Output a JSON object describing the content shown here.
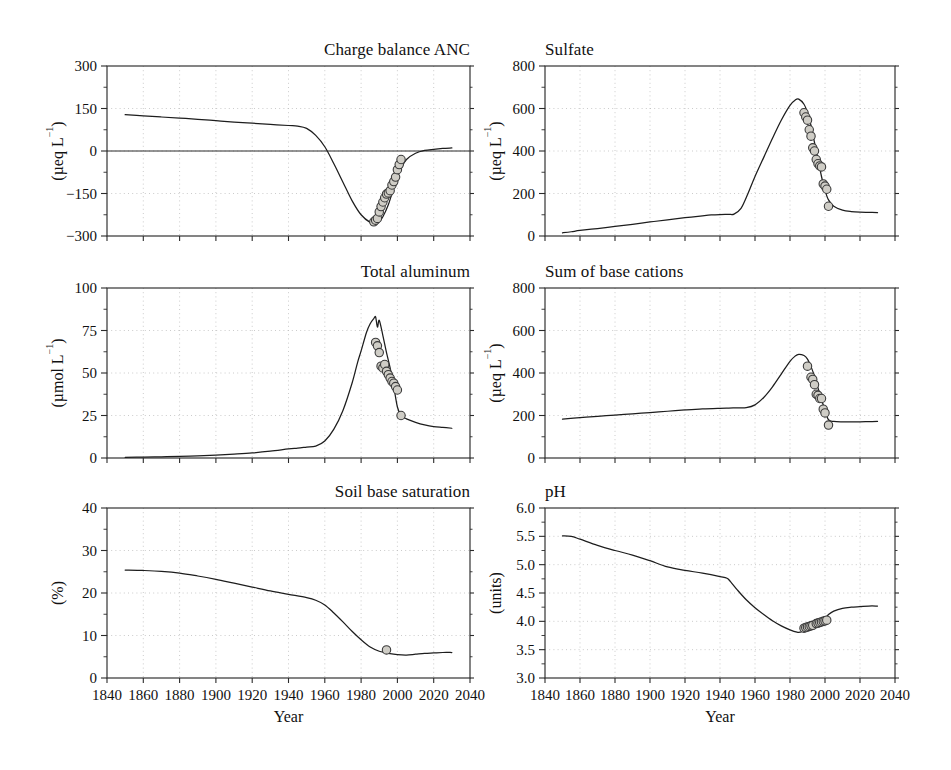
{
  "figure": {
    "xlabel": "Year",
    "marker_face_color": "#cfcdc6",
    "marker_edge_color": "#3a3a3a",
    "line_color": "#1d1d1d"
  },
  "chart_data": [
    {
      "id": "charge-balance-anc",
      "type": "line",
      "title": "Charge balance ANC",
      "xlabel": "Year",
      "ylabel": "(µeq L⁻¹)",
      "ylabel_main": "(µeq L",
      "ylabel_sup": "−1",
      "ylabel_tail": ")",
      "xlim": [
        1840,
        2040
      ],
      "ylim": [
        -300,
        300
      ],
      "xticks": [
        1840,
        1860,
        1880,
        1900,
        1920,
        1940,
        1960,
        1980,
        2000,
        2020,
        2040
      ],
      "yticks": [
        -300,
        -150,
        0,
        150,
        300
      ],
      "ytick_labels": [
        "−300",
        "−150",
        "0",
        "150",
        "300"
      ],
      "grid": true,
      "zero_line": true,
      "series": [
        {
          "name": "model",
          "x": [
            1850,
            1860,
            1870,
            1880,
            1890,
            1900,
            1910,
            1920,
            1930,
            1940,
            1945,
            1950,
            1955,
            1960,
            1965,
            1970,
            1975,
            1980,
            1985,
            1988,
            1990,
            1992,
            1995,
            1998,
            2000,
            2002,
            2005,
            2010,
            2015,
            2020,
            2025,
            2030
          ],
          "y": [
            128,
            124,
            120,
            116,
            112,
            107,
            102,
            98,
            94,
            90,
            88,
            80,
            55,
            15,
            -45,
            -110,
            -175,
            -225,
            -252,
            -255,
            -248,
            -232,
            -190,
            -130,
            -92,
            -62,
            -30,
            -8,
            2,
            6,
            9,
            11
          ]
        }
      ],
      "observations": {
        "x": [
          1987,
          1988,
          1989,
          1990,
          1991,
          1992,
          1993,
          1994,
          1995,
          1996,
          1997,
          1998,
          1999,
          2000,
          2001,
          2002
        ],
        "y": [
          -250,
          -244,
          -238,
          -215,
          -196,
          -180,
          -165,
          -152,
          -148,
          -140,
          -120,
          -108,
          -92,
          -66,
          -48,
          -30
        ]
      }
    },
    {
      "id": "sulfate",
      "type": "line",
      "title": "Sulfate",
      "xlabel": "Year",
      "ylabel": "(µeq L⁻¹)",
      "ylabel_main": "(µeq L",
      "ylabel_sup": "−1",
      "ylabel_tail": ")",
      "xlim": [
        1840,
        2040
      ],
      "ylim": [
        0,
        800
      ],
      "xticks": [
        1840,
        1860,
        1880,
        1900,
        1920,
        1940,
        1960,
        1980,
        2000,
        2020,
        2040
      ],
      "yticks": [
        0,
        200,
        400,
        600,
        800
      ],
      "ytick_labels": [
        "0",
        "200",
        "400",
        "600",
        "800"
      ],
      "grid": true,
      "zero_line": false,
      "series": [
        {
          "name": "model",
          "x": [
            1850,
            1855,
            1860,
            1870,
            1880,
            1890,
            1900,
            1910,
            1920,
            1930,
            1935,
            1940,
            1945,
            1948,
            1952,
            1956,
            1960,
            1965,
            1970,
            1975,
            1980,
            1983,
            1985,
            1988,
            1990,
            1992,
            1994,
            1996,
            1998,
            2000,
            2002,
            2005,
            2010,
            2015,
            2020,
            2025,
            2030
          ],
          "y": [
            15,
            20,
            26,
            35,
            45,
            55,
            66,
            76,
            86,
            95,
            99,
            101,
            102,
            103,
            130,
            200,
            280,
            370,
            460,
            545,
            615,
            640,
            644,
            620,
            580,
            520,
            440,
            360,
            280,
            215,
            170,
            140,
            122,
            115,
            112,
            111,
            110
          ]
        }
      ],
      "observations": {
        "x": [
          1988,
          1989,
          1990,
          1991,
          1992,
          1993,
          1994,
          1995,
          1996,
          1997,
          1998,
          1999,
          2000,
          2001,
          2002
        ],
        "y": [
          580,
          560,
          545,
          500,
          470,
          415,
          400,
          360,
          340,
          330,
          325,
          245,
          235,
          220,
          140
        ]
      }
    },
    {
      "id": "total-aluminum",
      "type": "line",
      "title": "Total aluminum",
      "xlabel": "Year",
      "ylabel": "(µmol L⁻¹)",
      "ylabel_main": "(µmol L",
      "ylabel_sup": "−1",
      "ylabel_tail": ")",
      "xlim": [
        1840,
        2040
      ],
      "ylim": [
        0,
        100
      ],
      "xticks": [
        1840,
        1860,
        1880,
        1900,
        1920,
        1940,
        1960,
        1980,
        2000,
        2020,
        2040
      ],
      "yticks": [
        0,
        25,
        50,
        75,
        100
      ],
      "ytick_labels": [
        "0",
        "25",
        "50",
        "75",
        "100"
      ],
      "grid": true,
      "zero_line": false,
      "series": [
        {
          "name": "model",
          "x": [
            1850,
            1860,
            1870,
            1880,
            1890,
            1900,
            1910,
            1920,
            1930,
            1940,
            1945,
            1950,
            1955,
            1960,
            1965,
            1970,
            1975,
            1978,
            1980,
            1983,
            1985,
            1987,
            1988,
            1989,
            1990,
            1992,
            1994,
            1996,
            1998,
            2000,
            2002,
            2005,
            2010,
            2015,
            2020,
            2025,
            2030
          ],
          "y": [
            0.4,
            0.5,
            0.7,
            0.9,
            1.2,
            1.7,
            2.3,
            3.0,
            4.0,
            5.3,
            5.8,
            6.4,
            7.0,
            10,
            17,
            28,
            44,
            56,
            63,
            74,
            79,
            82,
            83,
            77,
            81,
            72,
            62,
            53,
            42,
            30,
            25,
            23,
            21,
            19.5,
            18.5,
            18,
            17.5
          ]
        }
      ],
      "observations": {
        "x": [
          1988,
          1989,
          1990,
          1991,
          1992,
          1993,
          1994,
          1995,
          1996,
          1997,
          1998,
          1999,
          2000,
          2002
        ],
        "y": [
          68,
          66,
          62,
          54,
          53,
          55,
          51,
          49,
          47,
          45,
          44,
          42,
          40,
          25
        ]
      }
    },
    {
      "id": "sum-of-base-cations",
      "type": "line",
      "title": "Sum of base cations",
      "xlabel": "Year",
      "ylabel": "(µeq L⁻¹)",
      "ylabel_main": "(µeq L",
      "ylabel_sup": "−1",
      "ylabel_tail": ")",
      "xlim": [
        1840,
        2040
      ],
      "ylim": [
        0,
        800
      ],
      "xticks": [
        1840,
        1860,
        1880,
        1900,
        1920,
        1940,
        1960,
        1980,
        2000,
        2020,
        2040
      ],
      "yticks": [
        0,
        200,
        400,
        600,
        800
      ],
      "ytick_labels": [
        "0",
        "200",
        "400",
        "600",
        "800"
      ],
      "grid": true,
      "zero_line": false,
      "series": [
        {
          "name": "model",
          "x": [
            1850,
            1860,
            1870,
            1880,
            1890,
            1900,
            1910,
            1920,
            1930,
            1940,
            1945,
            1950,
            1955,
            1960,
            1965,
            1970,
            1975,
            1980,
            1983,
            1985,
            1988,
            1990,
            1992,
            1994,
            1996,
            1998,
            2000,
            2002,
            2005,
            2010,
            2015,
            2020,
            2025,
            2030
          ],
          "y": [
            183,
            190,
            196,
            202,
            208,
            214,
            220,
            226,
            231,
            234,
            235,
            236,
            237,
            250,
            285,
            335,
            395,
            455,
            480,
            488,
            482,
            465,
            430,
            385,
            330,
            275,
            225,
            180,
            172,
            170,
            170,
            170,
            171,
            172
          ]
        }
      ],
      "observations": {
        "x": [
          1990,
          1992,
          1993,
          1994,
          1995,
          1996,
          1997,
          1998,
          1999,
          2000,
          2002
        ],
        "y": [
          432,
          380,
          370,
          345,
          300,
          295,
          280,
          280,
          230,
          212,
          155
        ]
      }
    },
    {
      "id": "soil-base-saturation",
      "type": "line",
      "title": "Soil base saturation",
      "xlabel": "Year",
      "ylabel": "(%)",
      "ylabel_main": "(%)",
      "ylabel_sup": "",
      "ylabel_tail": "",
      "xlim": [
        1840,
        2040
      ],
      "ylim": [
        0,
        40
      ],
      "xticks": [
        1840,
        1860,
        1880,
        1900,
        1920,
        1940,
        1960,
        1980,
        2000,
        2020,
        2040
      ],
      "yticks": [
        0,
        10,
        20,
        30,
        40
      ],
      "ytick_labels": [
        "0",
        "10",
        "20",
        "30",
        "40"
      ],
      "grid": true,
      "zero_line": false,
      "series": [
        {
          "name": "model",
          "x": [
            1850,
            1860,
            1870,
            1880,
            1890,
            1900,
            1910,
            1920,
            1930,
            1940,
            1950,
            1955,
            1960,
            1965,
            1970,
            1975,
            1980,
            1985,
            1990,
            1993,
            1995,
            2000,
            2005,
            2010,
            2015,
            2020,
            2025,
            2030
          ],
          "y": [
            25.4,
            25.3,
            25.1,
            24.7,
            24.0,
            23.2,
            22.3,
            21.4,
            20.5,
            19.7,
            18.9,
            18.3,
            17.2,
            15.3,
            13.2,
            11.0,
            9.0,
            7.3,
            6.3,
            6.0,
            5.8,
            5.5,
            5.4,
            5.6,
            5.8,
            5.9,
            6.0,
            6.0
          ]
        }
      ],
      "observations": {
        "x": [
          1994
        ],
        "y": [
          6.6
        ]
      }
    },
    {
      "id": "ph",
      "type": "line",
      "title": "pH",
      "xlabel": "Year",
      "ylabel": "(units)",
      "ylabel_main": "(units)",
      "ylabel_sup": "",
      "ylabel_tail": "",
      "xlim": [
        1840,
        2040
      ],
      "ylim": [
        3.0,
        6.0
      ],
      "xticks": [
        1840,
        1860,
        1880,
        1900,
        1920,
        1940,
        1960,
        1980,
        2000,
        2020,
        2040
      ],
      "yticks": [
        3.0,
        3.5,
        4.0,
        4.5,
        5.0,
        5.5,
        6.0
      ],
      "ytick_labels": [
        "3.0",
        "3.5",
        "4.0",
        "4.5",
        "5.0",
        "5.5",
        "6.0"
      ],
      "grid": true,
      "zero_line": false,
      "series": [
        {
          "name": "model",
          "x": [
            1850,
            1855,
            1860,
            1870,
            1880,
            1890,
            1900,
            1910,
            1920,
            1930,
            1940,
            1944,
            1946,
            1950,
            1955,
            1960,
            1965,
            1970,
            1975,
            1980,
            1984,
            1986,
            1988,
            1990,
            1992,
            1995,
            1998,
            2000,
            2002,
            2005,
            2010,
            2015,
            2020,
            2025,
            2030
          ],
          "y": [
            5.51,
            5.5,
            5.45,
            5.34,
            5.25,
            5.17,
            5.07,
            4.96,
            4.9,
            4.85,
            4.79,
            4.76,
            4.7,
            4.55,
            4.38,
            4.24,
            4.12,
            4.01,
            3.92,
            3.85,
            3.81,
            3.81,
            3.83,
            3.86,
            3.89,
            3.94,
            4.0,
            4.05,
            4.12,
            4.18,
            4.23,
            4.25,
            4.26,
            4.27,
            4.27
          ]
        }
      ],
      "observations": {
        "x": [
          1988,
          1989,
          1990,
          1991,
          1992,
          1993,
          1995,
          1996,
          1997,
          1998,
          1999,
          2000,
          2001
        ],
        "y": [
          3.88,
          3.89,
          3.9,
          3.91,
          3.92,
          3.93,
          3.96,
          3.97,
          3.98,
          3.99,
          4.0,
          4.01,
          4.02
        ]
      }
    }
  ]
}
